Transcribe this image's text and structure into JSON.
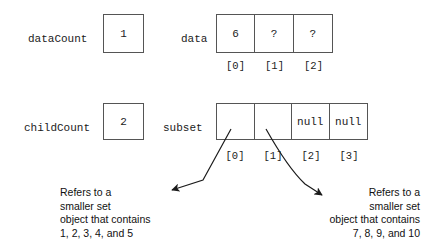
{
  "diagram": {
    "stroke_color": "#555555",
    "text_color": "#1b1b1b",
    "background": "#ffffff"
  },
  "data_count": {
    "label": "dataCount",
    "value": "1"
  },
  "child_count": {
    "label": "childCount",
    "value": "2"
  },
  "data_array": {
    "label": "data",
    "cells": [
      "6",
      "?",
      "?"
    ],
    "indices": [
      "[0]",
      "[1]",
      "[2]"
    ]
  },
  "subset_array": {
    "label": "subset",
    "cells": [
      "",
      "",
      "null",
      "null"
    ],
    "indices": [
      "[0]",
      "[1]",
      "[2]",
      "[3]"
    ]
  },
  "annotations": {
    "left": {
      "line1": "Refers to a",
      "line2": "smaller set",
      "line3": "object that contains",
      "line4": "1, 2, 3, 4, and 5"
    },
    "right": {
      "line1": "Refers to a",
      "line2": "smaller set",
      "line3": "object that contains",
      "line4": "7, 8, 9, and 10"
    }
  }
}
